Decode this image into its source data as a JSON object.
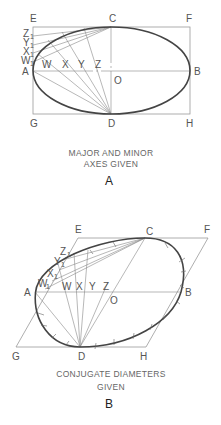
{
  "figure_a": {
    "corner_labels": {
      "E": "E",
      "C": "C",
      "F": "F",
      "A": "A",
      "O": "O",
      "B": "B",
      "G": "G",
      "D": "D",
      "H": "H"
    },
    "side_labels": [
      "Z",
      "Y",
      "X",
      "W"
    ],
    "side_subscript": "1",
    "axis_labels": [
      "W",
      "X",
      "Y",
      "Z"
    ],
    "caption_line1": "MAJOR AND MINOR",
    "caption_line2": "AXES GIVEN",
    "figure_letter": "A"
  },
  "figure_b": {
    "corner_labels": {
      "E": "E",
      "C": "C",
      "F": "F",
      "A": "A",
      "O": "O",
      "B": "B",
      "G": "G",
      "D": "D",
      "H": "H"
    },
    "side_labels": [
      "Z",
      "Y",
      "X",
      "W"
    ],
    "side_subscript": "1",
    "axis_labels": [
      "W",
      "X",
      "Y",
      "Z"
    ],
    "caption_line1": "CONJUGATE DIAMETERS",
    "caption_line2": "GIVEN",
    "figure_letter": "B"
  }
}
